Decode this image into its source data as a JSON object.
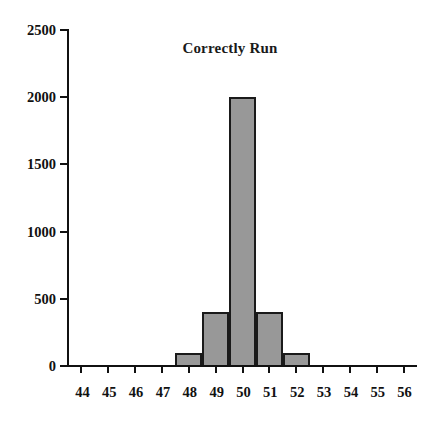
{
  "chart_data": {
    "type": "bar",
    "title": "Correctly Run",
    "xlabel": "",
    "ylabel": "",
    "categories": [
      "44",
      "45",
      "46",
      "47",
      "48",
      "49",
      "50",
      "51",
      "52",
      "53",
      "54",
      "55",
      "56"
    ],
    "x": [
      44,
      45,
      46,
      47,
      48,
      49,
      50,
      51,
      52,
      53,
      54,
      55,
      56
    ],
    "values": [
      0,
      0,
      0,
      0,
      100,
      400,
      2000,
      400,
      100,
      0,
      0,
      0,
      0
    ],
    "bars": [
      {
        "center": 48,
        "value": 100
      },
      {
        "center": 49,
        "value": 400
      },
      {
        "center": 50,
        "value": 2000
      },
      {
        "center": 51,
        "value": 400
      },
      {
        "center": 52,
        "value": 100
      }
    ],
    "xlim": [
      43.5,
      56.5
    ],
    "ylim": [
      0,
      2500
    ],
    "y_ticks": [
      0,
      500,
      1000,
      1500,
      2000,
      2500
    ],
    "y_tick_labels": [
      "0",
      "500",
      "1000",
      "1500",
      "2000",
      "2500"
    ],
    "x_tick_labels": [
      "44",
      "45",
      "46",
      "47",
      "48",
      "49",
      "50",
      "51",
      "52",
      "53",
      "54",
      "55",
      "56"
    ],
    "grid": false,
    "legend": null,
    "colors": {
      "bar_fill": "#989898",
      "bar_edge": "#1a1a1a",
      "axis": "#111111",
      "text": "#111111",
      "background": "#ffffff"
    }
  }
}
